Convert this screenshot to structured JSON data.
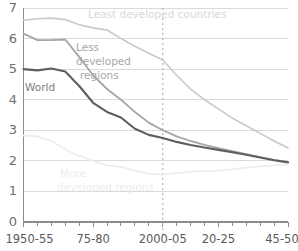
{
  "chart_data": {
    "type": "line",
    "title": "",
    "subtitle": "",
    "xlabel": "",
    "ylabel": "",
    "xlim": [
      0,
      19
    ],
    "ylim": [
      0,
      7
    ],
    "grid": true,
    "legend_position": "inline-annotations",
    "y_ticks": [
      "0",
      "1",
      "2",
      "3",
      "4",
      "5",
      "6",
      "7"
    ],
    "y_tick_values": [
      0,
      1,
      2,
      3,
      4,
      5,
      6,
      7
    ],
    "x_categories": [
      "1950-55",
      "1955-60",
      "1960-65",
      "1965-70",
      "1970-75",
      "1975-80",
      "1980-85",
      "1985-90",
      "1990-95",
      "1995-2000",
      "2000-05",
      "2005-10",
      "2010-15",
      "2015-20",
      "2020-25",
      "2025-30",
      "2030-35",
      "2035-40",
      "2040-45",
      "2045-50"
    ],
    "x_tick_labels": [
      "1950-55",
      "75-80",
      "2000-05",
      "20-25",
      "45-50"
    ],
    "x_tick_indices": [
      0,
      5,
      10,
      14,
      19
    ],
    "marker_line": {
      "label": "2000-05",
      "x_index": 10,
      "style": "dotted",
      "color": "#bdbdbd"
    },
    "series": [
      {
        "name": "Least developed countries",
        "color": "#c9c9c9",
        "width": 1.6,
        "label_text": "Least developed countries",
        "label_lines": [
          "Least developed countries"
        ],
        "values": [
          6.6,
          6.65,
          6.67,
          6.62,
          6.45,
          6.35,
          6.28,
          6.0,
          5.75,
          5.52,
          5.3,
          4.8,
          4.35,
          4.0,
          3.7,
          3.4,
          3.15,
          2.9,
          2.65,
          2.42
        ]
      },
      {
        "name": "Less developed regions",
        "color": "#a6a6a6",
        "width": 1.8,
        "label_text": "Less developed regions",
        "label_lines": [
          "Less",
          "developed",
          "regions"
        ],
        "values": [
          6.16,
          5.95,
          5.95,
          5.97,
          5.4,
          4.8,
          4.35,
          4.0,
          3.6,
          3.25,
          3.0,
          2.8,
          2.65,
          2.52,
          2.42,
          2.32,
          2.22,
          2.12,
          2.03,
          1.96
        ]
      },
      {
        "name": "World",
        "color": "#5e5e5e",
        "width": 2.1,
        "label_text": "World",
        "label_lines": [
          "World"
        ],
        "values": [
          5.0,
          4.96,
          5.02,
          4.92,
          4.45,
          3.9,
          3.6,
          3.42,
          3.05,
          2.85,
          2.75,
          2.62,
          2.52,
          2.44,
          2.36,
          2.28,
          2.2,
          2.11,
          2.02,
          1.95
        ]
      },
      {
        "name": "More developed regions",
        "color": "#ededed",
        "width": 1.8,
        "label_text": "More developed regions",
        "label_lines": [
          "More",
          "developed regions"
        ],
        "values": [
          2.83,
          2.8,
          2.65,
          2.38,
          2.16,
          2.0,
          1.85,
          1.8,
          1.68,
          1.58,
          1.55,
          1.6,
          1.65,
          1.67,
          1.68,
          1.72,
          1.78,
          1.82,
          1.85,
          1.88
        ]
      }
    ],
    "annotations": [
      {
        "name": "least-developed-label",
        "text": "Least developed countries",
        "x": 88,
        "y": 18
      },
      {
        "name": "less-developed-label-1",
        "text": "Less",
        "x": 76,
        "y": 51
      },
      {
        "name": "less-developed-label-2",
        "text": "developed",
        "x": 76,
        "y": 65
      },
      {
        "name": "less-developed-label-3",
        "text": "regions",
        "x": 80,
        "y": 79
      },
      {
        "name": "world-label",
        "text": "World",
        "x": 25,
        "y": 91
      },
      {
        "name": "more-developed-label-1",
        "text": "More",
        "x": 60,
        "y": 177
      },
      {
        "name": "more-developed-label-2",
        "text": "developed regions",
        "x": 57,
        "y": 191
      }
    ]
  }
}
